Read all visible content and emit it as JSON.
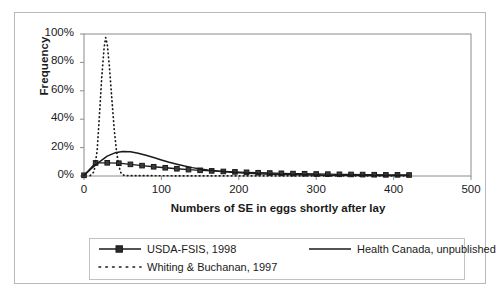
{
  "chart_data": {
    "type": "line",
    "title": "",
    "xlabel": "Numbers of SE in eggs shortly after lay",
    "ylabel": "Frequency",
    "xlim": [
      0,
      500
    ],
    "ylim": [
      0,
      1.0
    ],
    "grid": false,
    "legend_position": "bottom",
    "xticks": [
      0,
      100,
      200,
      300,
      400,
      500
    ],
    "xtick_labels": [
      "0",
      "100",
      "200",
      "300",
      "400",
      "500"
    ],
    "yticks": [
      0,
      0.2,
      0.4,
      0.6,
      0.8,
      1.0
    ],
    "ytick_labels": [
      "0%",
      "20%",
      "40%",
      "60%",
      "80%",
      "100%"
    ],
    "series": [
      {
        "name": "USDA-FSIS, 1998",
        "style": "solid-with-square-markers",
        "color": "#1a1a1a",
        "points": [
          [
            0,
            0.005
          ],
          [
            15,
            0.092
          ],
          [
            30,
            0.093
          ],
          [
            45,
            0.09
          ],
          [
            60,
            0.082
          ],
          [
            75,
            0.073
          ],
          [
            90,
            0.065
          ],
          [
            105,
            0.058
          ],
          [
            120,
            0.051
          ],
          [
            135,
            0.045
          ],
          [
            150,
            0.04
          ],
          [
            165,
            0.036
          ],
          [
            180,
            0.032
          ],
          [
            195,
            0.029
          ],
          [
            210,
            0.026
          ],
          [
            225,
            0.023
          ],
          [
            240,
            0.021
          ],
          [
            255,
            0.019
          ],
          [
            270,
            0.017
          ],
          [
            285,
            0.016
          ],
          [
            300,
            0.014
          ],
          [
            315,
            0.013
          ],
          [
            330,
            0.012
          ],
          [
            345,
            0.011
          ],
          [
            360,
            0.01
          ],
          [
            375,
            0.009
          ],
          [
            390,
            0.008
          ],
          [
            405,
            0.008
          ],
          [
            420,
            0.007
          ]
        ]
      },
      {
        "name": "Health Canada, unpublished",
        "style": "solid",
        "color": "#1a1a1a",
        "points": [
          [
            0,
            0.003
          ],
          [
            10,
            0.055
          ],
          [
            20,
            0.1
          ],
          [
            30,
            0.14
          ],
          [
            40,
            0.163
          ],
          [
            50,
            0.172
          ],
          [
            60,
            0.17
          ],
          [
            70,
            0.16
          ],
          [
            80,
            0.146
          ],
          [
            90,
            0.13
          ],
          [
            100,
            0.113
          ],
          [
            110,
            0.097
          ],
          [
            120,
            0.083
          ],
          [
            130,
            0.07
          ],
          [
            140,
            0.059
          ],
          [
            150,
            0.05
          ],
          [
            160,
            0.042
          ],
          [
            175,
            0.033
          ],
          [
            190,
            0.026
          ],
          [
            205,
            0.021
          ],
          [
            220,
            0.017
          ],
          [
            240,
            0.013
          ],
          [
            260,
            0.01
          ],
          [
            285,
            0.008
          ],
          [
            310,
            0.006
          ],
          [
            340,
            0.005
          ],
          [
            375,
            0.004
          ],
          [
            410,
            0.003
          ],
          [
            420,
            0.003
          ]
        ]
      },
      {
        "name": "Whiting & Buchanan, 1997",
        "style": "dotted",
        "color": "#1a1a1a",
        "points": [
          [
            8,
            0.003
          ],
          [
            13,
            0.03
          ],
          [
            17,
            0.18
          ],
          [
            20,
            0.43
          ],
          [
            23,
            0.7
          ],
          [
            26,
            0.905
          ],
          [
            28,
            0.975
          ],
          [
            30,
            0.93
          ],
          [
            33,
            0.76
          ],
          [
            36,
            0.54
          ],
          [
            39,
            0.33
          ],
          [
            42,
            0.175
          ],
          [
            45,
            0.07
          ],
          [
            48,
            0.018
          ],
          [
            52,
            0.004
          ],
          [
            60,
            0.002
          ],
          [
            90,
            0.002
          ],
          [
            150,
            0.001
          ],
          [
            250,
            0.001
          ],
          [
            420,
            0.001
          ]
        ]
      }
    ]
  },
  "legend": {
    "entries": [
      {
        "label": "USDA-FSIS, 1998",
        "style": "solid-with-square-markers"
      },
      {
        "label": "Health Canada, unpublished",
        "style": "solid"
      },
      {
        "label": "Whiting & Buchanan, 1997",
        "style": "dotted"
      }
    ]
  }
}
